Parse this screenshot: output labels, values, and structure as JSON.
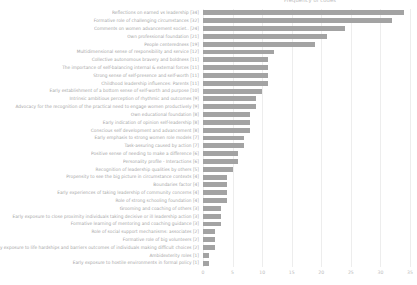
{
  "chart_data": {
    "type": "bar",
    "orientation": "horizontal",
    "title": "Frequency of codes",
    "xlabel": "",
    "ylabel": "",
    "xlim": [
      0,
      35
    ],
    "xticks": [
      0,
      5,
      10,
      15,
      20,
      25,
      30,
      35
    ],
    "xtick_labels": [
      "0",
      "5",
      "10",
      "15",
      "20",
      "25",
      "30",
      "35"
    ],
    "grid": true,
    "legend": null,
    "bar_color": "#a3a3a3",
    "categories": [
      "Reflections on earned vs leadership [34]",
      "Formative role of challenging circumstances [32]",
      "Comments on women advancement societ.. [24]",
      "Own professional foundation [21]",
      "People centeredness [19]",
      "Multidimensional sense of responsibility and service [12]",
      "Collective autonomous bravery and boldness [11]",
      "The importance of self-balancing internal & external forces [11]",
      "Strong sense of self-presence and self-worth [11]",
      "Childhood leadership influences: Parents [11]",
      "Early establishment of a bottom sense of self-worth and purpose [10]",
      "Intrinsic ambitious perception of rhythmic and outcomes [9]",
      "Advocacy for the recognition of the practical need to engage women productively [9]",
      "Own educational foundation [8]",
      "Early indication of opinion self-leadership [8]",
      "Conscious self development and advancement [8]",
      "Early emphasis to strong women role models [7]",
      "Task-assuring caused by action [7]",
      "Positive sense of needing to make a difference [6]",
      "Personality profile - Interactions [6]",
      "Recognition of leadership qualities by others [5]",
      "Propensity to see the big picture in circumstance contexts [4]",
      "Boundaries factor [4]",
      "Early experiences of taking leadership of community concerns [4]",
      "Role of strong schooling foundation [4]",
      "Grooming and coaching of others [3]",
      "Early exposure to close proximity individuals taking decisive or ill leadership action [3]",
      "Formative learning of mentoring and coaching guidance [3]",
      "Role of social support mechanisms: associates [2]",
      "Formative role of big volunteers [2]",
      "Early exposure to life hardships and barriers outcomes of individuals making difficult choices [2]",
      "Ambidexterity roles [1]",
      "Early exposure to hostile environments in formal policy [1]"
    ],
    "values": [
      34,
      32,
      24,
      21,
      19,
      12,
      11,
      11,
      11,
      11,
      10,
      9,
      9,
      8,
      8,
      8,
      7,
      7,
      6,
      6,
      5,
      4,
      4,
      4,
      4,
      3,
      3,
      3,
      2,
      2,
      2,
      1,
      1
    ]
  }
}
